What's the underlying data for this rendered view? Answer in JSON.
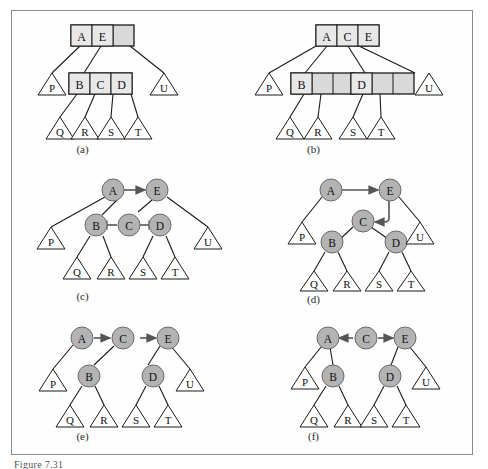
{
  "figure": {
    "caption": "Figure 7.31",
    "frame_color": "#8a8a8a",
    "node_fill_box": "#d9d9d9",
    "node_fill_circle": "#b3b3b3",
    "line_color": "#1a1a1a",
    "background": "#fefefe"
  },
  "panels": [
    {
      "id": "a",
      "label": "(a)",
      "type": "btree",
      "description": "2-3-4 tree with root node containing A and E",
      "nodes": [
        {
          "name": "root",
          "kind": "box",
          "slots": [
            "A",
            "E",
            ""
          ],
          "filled": 2
        },
        {
          "name": "internal-bcd",
          "kind": "box",
          "slots": [
            "B",
            "C",
            "D"
          ],
          "filled": 3
        },
        {
          "name": "leaf-p",
          "kind": "triangle",
          "label": "P"
        },
        {
          "name": "leaf-u",
          "kind": "triangle",
          "label": "U"
        },
        {
          "name": "leaf-q",
          "kind": "triangle",
          "label": "Q"
        },
        {
          "name": "leaf-r",
          "kind": "triangle",
          "label": "R"
        },
        {
          "name": "leaf-s",
          "kind": "triangle",
          "label": "S"
        },
        {
          "name": "leaf-t",
          "kind": "triangle",
          "label": "T"
        }
      ]
    },
    {
      "id": "b",
      "label": "(b)",
      "type": "btree",
      "description": "2-3-4 tree after split: root contains A, C, E",
      "nodes": [
        {
          "name": "root",
          "kind": "box",
          "slots": [
            "A",
            "C",
            "E"
          ],
          "filled": 3
        },
        {
          "name": "internal-b",
          "kind": "box",
          "slots": [
            "B",
            "",
            ""
          ],
          "filled": 1
        },
        {
          "name": "internal-d",
          "kind": "box",
          "slots": [
            "D",
            "",
            ""
          ],
          "filled": 1
        },
        {
          "name": "leaf-p",
          "kind": "triangle",
          "label": "P"
        },
        {
          "name": "leaf-u",
          "kind": "triangle",
          "label": "U"
        },
        {
          "name": "leaf-q",
          "kind": "triangle",
          "label": "Q"
        },
        {
          "name": "leaf-r",
          "kind": "triangle",
          "label": "R"
        },
        {
          "name": "leaf-s",
          "kind": "triangle",
          "label": "S"
        },
        {
          "name": "leaf-t",
          "kind": "triangle",
          "label": "T"
        }
      ]
    },
    {
      "id": "c",
      "label": "(c)",
      "type": "rbtree",
      "description": "Red-black representation, A->E, C->B and C->D arrows",
      "nodes": [
        {
          "name": "node-a",
          "kind": "circle",
          "label": "A"
        },
        {
          "name": "node-e",
          "kind": "circle",
          "label": "E"
        },
        {
          "name": "node-b",
          "kind": "circle",
          "label": "B"
        },
        {
          "name": "node-c",
          "kind": "circle",
          "label": "C"
        },
        {
          "name": "node-d",
          "kind": "circle",
          "label": "D"
        },
        {
          "name": "leaf-p",
          "kind": "triangle",
          "label": "P"
        },
        {
          "name": "leaf-q",
          "kind": "triangle",
          "label": "Q"
        },
        {
          "name": "leaf-r",
          "kind": "triangle",
          "label": "R"
        },
        {
          "name": "leaf-s",
          "kind": "triangle",
          "label": "S"
        },
        {
          "name": "leaf-t",
          "kind": "triangle",
          "label": "T"
        },
        {
          "name": "leaf-u",
          "kind": "triangle",
          "label": "U"
        }
      ],
      "arrows": [
        "A to E",
        "C to B",
        "C to D"
      ]
    },
    {
      "id": "d",
      "label": "(d)",
      "type": "rbtree",
      "description": "Rotation step, A->E and E->C arrows",
      "nodes": [
        {
          "name": "node-a",
          "kind": "circle",
          "label": "A"
        },
        {
          "name": "node-e",
          "kind": "circle",
          "label": "E"
        },
        {
          "name": "node-c",
          "kind": "circle",
          "label": "C"
        },
        {
          "name": "node-b",
          "kind": "circle",
          "label": "B"
        },
        {
          "name": "node-d",
          "kind": "circle",
          "label": "D"
        },
        {
          "name": "leaf-p",
          "kind": "triangle",
          "label": "P"
        },
        {
          "name": "leaf-u",
          "kind": "triangle",
          "label": "U"
        },
        {
          "name": "leaf-q",
          "kind": "triangle",
          "label": "Q"
        },
        {
          "name": "leaf-r",
          "kind": "triangle",
          "label": "R"
        },
        {
          "name": "leaf-s",
          "kind": "triangle",
          "label": "S"
        },
        {
          "name": "leaf-t",
          "kind": "triangle",
          "label": "T"
        }
      ],
      "arrows": [
        "A to E",
        "E to C"
      ]
    },
    {
      "id": "e",
      "label": "(e)",
      "type": "rbtree",
      "description": "Chain A->C->E with subtrees",
      "nodes": [
        {
          "name": "node-a",
          "kind": "circle",
          "label": "A"
        },
        {
          "name": "node-c",
          "kind": "circle",
          "label": "C"
        },
        {
          "name": "node-e",
          "kind": "circle",
          "label": "E"
        },
        {
          "name": "node-b",
          "kind": "circle",
          "label": "B"
        },
        {
          "name": "node-d",
          "kind": "circle",
          "label": "D"
        },
        {
          "name": "leaf-p",
          "kind": "triangle",
          "label": "P"
        },
        {
          "name": "leaf-q",
          "kind": "triangle",
          "label": "Q"
        },
        {
          "name": "leaf-r",
          "kind": "triangle",
          "label": "R"
        },
        {
          "name": "leaf-s",
          "kind": "triangle",
          "label": "S"
        },
        {
          "name": "leaf-t",
          "kind": "triangle",
          "label": "T"
        },
        {
          "name": "leaf-u",
          "kind": "triangle",
          "label": "U"
        }
      ],
      "arrows": [
        "A to C",
        "C to E"
      ]
    },
    {
      "id": "f",
      "label": "(f)",
      "type": "rbtree",
      "description": "Final form, C points to A and to E",
      "nodes": [
        {
          "name": "node-a",
          "kind": "circle",
          "label": "A"
        },
        {
          "name": "node-c",
          "kind": "circle",
          "label": "C"
        },
        {
          "name": "node-e",
          "kind": "circle",
          "label": "E"
        },
        {
          "name": "node-b",
          "kind": "circle",
          "label": "B"
        },
        {
          "name": "node-d",
          "kind": "circle",
          "label": "D"
        },
        {
          "name": "leaf-p",
          "kind": "triangle",
          "label": "P"
        },
        {
          "name": "leaf-q",
          "kind": "triangle",
          "label": "Q"
        },
        {
          "name": "leaf-r",
          "kind": "triangle",
          "label": "R"
        },
        {
          "name": "leaf-s",
          "kind": "triangle",
          "label": "S"
        },
        {
          "name": "leaf-t",
          "kind": "triangle",
          "label": "T"
        },
        {
          "name": "leaf-u",
          "kind": "triangle",
          "label": "U"
        }
      ],
      "arrows": [
        "C to A",
        "C to E"
      ]
    }
  ]
}
